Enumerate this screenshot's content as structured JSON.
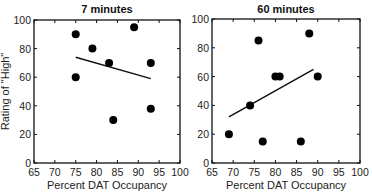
{
  "chart_data": [
    {
      "type": "scatter",
      "title": "7 minutes",
      "xlabel": "Percent DAT Occupancy",
      "ylabel": "Rating of \"High\"",
      "xlim": [
        65,
        100
      ],
      "ylim": [
        0,
        100
      ],
      "xticks": [
        "65",
        "70",
        "75",
        "80",
        "85",
        "90",
        "95",
        "100"
      ],
      "yticks": [
        "0",
        "20",
        "40",
        "60",
        "80",
        "100"
      ],
      "grid": false,
      "points": [
        {
          "x": 75,
          "y": 90
        },
        {
          "x": 75,
          "y": 60
        },
        {
          "x": 79,
          "y": 80
        },
        {
          "x": 83,
          "y": 70
        },
        {
          "x": 84,
          "y": 30
        },
        {
          "x": 89,
          "y": 95
        },
        {
          "x": 93,
          "y": 70
        },
        {
          "x": 93,
          "y": 38
        }
      ],
      "trendline": {
        "x1": 75,
        "y1": 74,
        "x2": 93,
        "y2": 59
      }
    },
    {
      "type": "scatter",
      "title": "60 minutes",
      "xlabel": "Percent DAT Occupancy",
      "ylabel": "",
      "xlim": [
        65,
        100
      ],
      "ylim": [
        0,
        100
      ],
      "xticks": [
        "65",
        "70",
        "75",
        "80",
        "85",
        "90",
        "95",
        "100"
      ],
      "yticks": [
        "0",
        "20",
        "40",
        "60",
        "80",
        "100"
      ],
      "grid": false,
      "points": [
        {
          "x": 69,
          "y": 20
        },
        {
          "x": 74,
          "y": 40
        },
        {
          "x": 76,
          "y": 85
        },
        {
          "x": 77,
          "y": 15
        },
        {
          "x": 80,
          "y": 60
        },
        {
          "x": 81,
          "y": 60
        },
        {
          "x": 86,
          "y": 15
        },
        {
          "x": 88,
          "y": 90
        },
        {
          "x": 90,
          "y": 60
        }
      ],
      "trendline": {
        "x1": 69,
        "y1": 32,
        "x2": 89,
        "y2": 65
      }
    }
  ],
  "plots": {
    "left": {
      "title": "7 minutes",
      "xlabel": "Percent DAT Occupancy",
      "ylabel": "Rating of \"High\""
    },
    "right": {
      "title": "60 minutes",
      "xlabel": "Percent DAT Occupancy"
    }
  }
}
